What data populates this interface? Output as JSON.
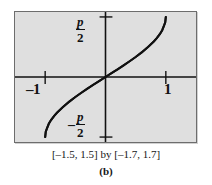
{
  "figure": {
    "panel_label": "(b)",
    "range_caption": "[–1.5, 1.5] by [–1.7, 1.7]"
  },
  "axis_labels": {
    "x_negative_one": "–1",
    "x_positive_one": "1",
    "y_pi_over_2_numerator": "p",
    "y_pi_over_2_denominator": "2",
    "y_neg_pi_over_2_sign": "–",
    "y_neg_pi_over_2_numerator": "p",
    "y_neg_pi_over_2_denominator": "2"
  },
  "colors": {
    "plot_background": "#dfdfdf",
    "frame_border": "#6d6d6d",
    "axis": "#111111",
    "curve": "#111111",
    "page_background": "#ffffff",
    "text": "#161616"
  },
  "chart_data": {
    "type": "line",
    "title": "",
    "subtitle": "",
    "xlabel": "",
    "ylabel": "",
    "function": "y = arcsin(x)",
    "xlim": [
      -1.5,
      1.5
    ],
    "ylim": [
      -1.7,
      1.7
    ],
    "grid": false,
    "legend": "none",
    "x_ticks": [
      -1,
      1
    ],
    "x_tick_labels": [
      "–1",
      "1"
    ],
    "y_ticks": [
      -1.5708,
      1.5708
    ],
    "y_tick_labels": [
      "–p/2",
      "p/2"
    ],
    "series": [
      {
        "name": "arcsin(x)",
        "x": [
          -1.0,
          -0.99,
          -0.97,
          -0.94,
          -0.9,
          -0.85,
          -0.8,
          -0.7,
          -0.6,
          -0.5,
          -0.4,
          -0.3,
          -0.2,
          -0.1,
          0.0,
          0.1,
          0.2,
          0.3,
          0.4,
          0.5,
          0.6,
          0.7,
          0.8,
          0.85,
          0.9,
          0.94,
          0.97,
          0.99,
          1.0
        ],
        "y": [
          -1.5708,
          -1.4287,
          -1.3453,
          -1.2239,
          -1.1198,
          -1.016,
          -0.9273,
          -0.7754,
          -0.6435,
          -0.5236,
          -0.4115,
          -0.3047,
          -0.2014,
          -0.1002,
          0.0,
          0.1002,
          0.2014,
          0.3047,
          0.4115,
          0.5236,
          0.6435,
          0.7754,
          0.9273,
          1.016,
          1.1198,
          1.2239,
          1.3453,
          1.4287,
          1.5708
        ]
      }
    ],
    "annotations": [
      {
        "text": "[–1.5, 1.5] by [–1.7, 1.7]",
        "position": "below-plot"
      },
      {
        "text": "(b)",
        "position": "bottom-center"
      }
    ]
  }
}
